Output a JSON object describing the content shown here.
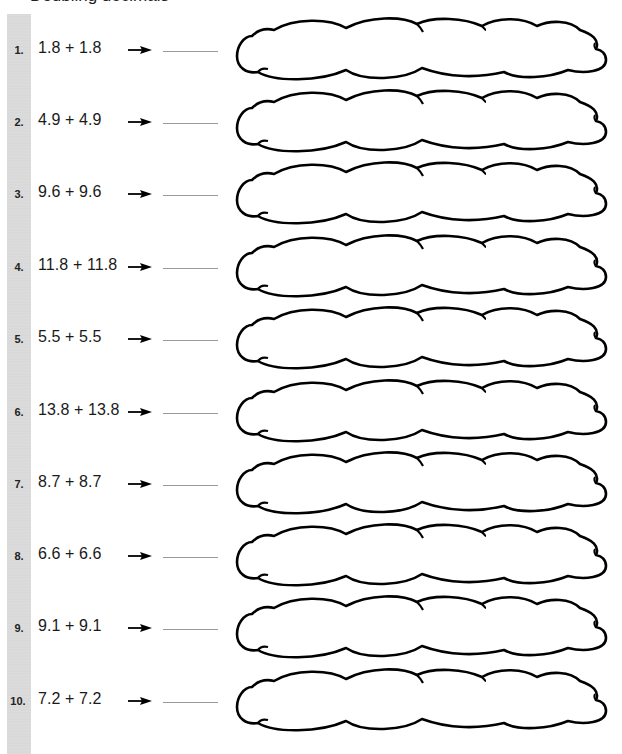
{
  "worksheet": {
    "heading_partial": "Doubling decimals",
    "problems": [
      {
        "number": "1.",
        "expression": "1.8 + 1.8",
        "arrow": "right-arrow-icon",
        "answer": ""
      },
      {
        "number": "2.",
        "expression": "4.9 + 4.9",
        "arrow": "right-arrow-icon",
        "answer": ""
      },
      {
        "number": "3.",
        "expression": "9.6 + 9.6",
        "arrow": "right-arrow-icon",
        "answer": ""
      },
      {
        "number": "4.",
        "expression": "11.8 + 11.8",
        "arrow": "right-arrow-icon",
        "answer": ""
      },
      {
        "number": "5.",
        "expression": "5.5 + 5.5",
        "arrow": "right-arrow-icon",
        "answer": ""
      },
      {
        "number": "6.",
        "expression": "13.8 + 13.8",
        "arrow": "right-arrow-icon",
        "answer": ""
      },
      {
        "number": "7.",
        "expression": "8.7 + 8.7",
        "arrow": "right-arrow-icon",
        "answer": ""
      },
      {
        "number": "8.",
        "expression": "6.6 + 6.6",
        "arrow": "right-arrow-icon",
        "answer": ""
      },
      {
        "number": "9.",
        "expression": "9.1 + 9.1",
        "arrow": "right-arrow-icon",
        "answer": ""
      },
      {
        "number": "10.",
        "expression": "7.2 + 7.2",
        "arrow": "right-arrow-icon",
        "answer": ""
      }
    ]
  },
  "colors": {
    "side_bar": "#d9d9d9",
    "text": "#1a1a1a",
    "answer_line": "#9a9a9a",
    "cloud_stroke": "#000000"
  }
}
